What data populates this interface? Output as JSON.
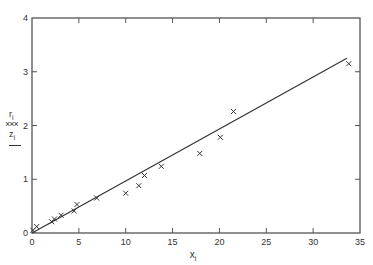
{
  "chart_data": {
    "type": "scatter",
    "title": "",
    "xlabel": "x_i",
    "ylabel": "r_i / z_i",
    "xlim": [
      0,
      35
    ],
    "ylim": [
      0,
      4
    ],
    "xticks": [
      0,
      5,
      10,
      15,
      20,
      25,
      30,
      35
    ],
    "yticks": [
      0,
      1,
      2,
      3,
      4
    ],
    "grid": false,
    "legend": [
      {
        "label": "r_i",
        "symbol": "×××",
        "type": "marker"
      },
      {
        "label": "z_i",
        "symbol": "——",
        "type": "line"
      }
    ],
    "series": [
      {
        "name": "r_i",
        "type": "scatter",
        "marker": "x",
        "x": [
          0.1,
          0.5,
          2.1,
          2.4,
          3.1,
          4.5,
          4.8,
          6.9,
          10.0,
          11.4,
          12.0,
          13.8,
          17.9,
          20.1,
          21.5,
          33.8
        ],
        "y": [
          0.05,
          0.12,
          0.21,
          0.26,
          0.33,
          0.41,
          0.53,
          0.65,
          0.74,
          0.88,
          1.07,
          1.24,
          1.48,
          1.78,
          2.26,
          3.15
        ]
      },
      {
        "name": "z_i",
        "type": "line",
        "x": [
          0,
          33.6
        ],
        "y": [
          0,
          3.25
        ]
      }
    ]
  },
  "labels": {
    "legend_r": "r",
    "legend_r_sub": "i",
    "legend_r_symbol": "×××",
    "legend_z": "z",
    "legend_z_sub": "i",
    "x_axis": "x",
    "x_axis_sub": "i"
  }
}
